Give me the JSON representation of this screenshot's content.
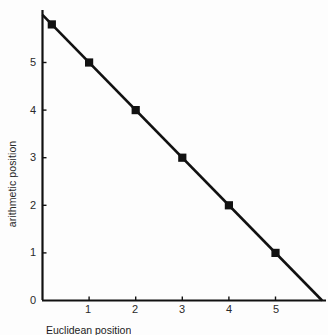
{
  "chart_data": {
    "type": "line",
    "title": "",
    "subtitle": "",
    "xlabel": "",
    "ylabel": "arithmetic position",
    "xlim": [
      0,
      6
    ],
    "ylim": [
      0,
      6
    ],
    "grid": false,
    "legend": null,
    "legend_position": "none",
    "xticks": [
      "1",
      "2",
      "3",
      "4",
      "5"
    ],
    "xtick_values": [
      1,
      2,
      3,
      4,
      5
    ],
    "yticks": [
      "0",
      "1",
      "2",
      "3",
      "4",
      "5"
    ],
    "ytick_values": [
      0,
      1,
      2,
      3,
      4,
      5
    ],
    "line_color": "#111111",
    "marker_color": "#111111",
    "marker_shape": "square",
    "series": [
      {
        "name": "arithmetic position",
        "x": [
          0.2,
          1,
          2,
          3,
          4,
          5
        ],
        "y": [
          5.8,
          5,
          4,
          3,
          2,
          1
        ],
        "line_x": [
          0,
          6
        ],
        "line_y": [
          6,
          0
        ]
      }
    ],
    "annotations": []
  },
  "axes": {
    "y_axis_title": "arithmetic position",
    "x_axis_title": ""
  },
  "caption": {
    "text": "Euclidean position"
  },
  "colors": {
    "background": "#fdfdfd",
    "foreground": "#111111",
    "text": "#2a2a2a"
  }
}
